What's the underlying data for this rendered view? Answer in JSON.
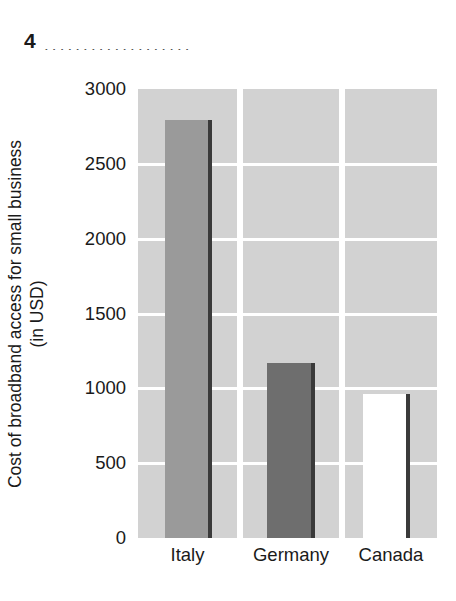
{
  "header": {
    "question_number": "4",
    "leader_dots": "...................."
  },
  "chart_data": {
    "type": "bar",
    "title": "",
    "xlabel": "",
    "ylabel_line1": "Cost of broadband access for small business",
    "ylabel_line2": "(in USD)",
    "categories": [
      "Italy",
      "Germany",
      "Canada"
    ],
    "values": [
      2790,
      1170,
      960
    ],
    "ylim": [
      0,
      3000
    ],
    "ytick_labels": [
      "3000",
      "2500",
      "2000",
      "1500",
      "1000",
      "500",
      "0"
    ],
    "ytick_values": [
      3000,
      2500,
      2000,
      1500,
      1000,
      500,
      0
    ],
    "grid": true,
    "legend": "none",
    "bar_colors": [
      "#9a9a9a",
      "#6e6e6e",
      "#ffffff"
    ],
    "bar_edge_color": "#3a3a3a",
    "plot_background": "#d2d2d2",
    "gridline_color": "#ffffff"
  }
}
